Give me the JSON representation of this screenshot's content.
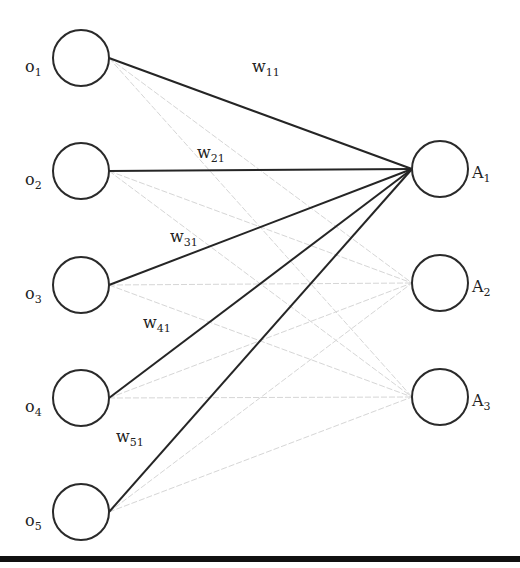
{
  "diagram": {
    "type": "fully-connected two-layer network",
    "colors": {
      "strong_edge": "#252525",
      "weak_edge": "#d6d6d6",
      "node_stroke": "#2a2a2a",
      "bottom_rule": "#111111"
    },
    "input_nodes": [
      {
        "id": "o1",
        "base": "o",
        "sub": "1",
        "cx": 81,
        "cy": 58
      },
      {
        "id": "o2",
        "base": "o",
        "sub": "2",
        "cx": 81,
        "cy": 171
      },
      {
        "id": "o3",
        "base": "o",
        "sub": "3",
        "cx": 81,
        "cy": 285
      },
      {
        "id": "o4",
        "base": "o",
        "sub": "4",
        "cx": 81,
        "cy": 398
      },
      {
        "id": "o5",
        "base": "o",
        "sub": "5",
        "cx": 81,
        "cy": 512
      }
    ],
    "output_nodes": [
      {
        "id": "A1",
        "base": "A",
        "sub": "1",
        "cx": 440,
        "cy": 169
      },
      {
        "id": "A2",
        "base": "A",
        "sub": "2",
        "cx": 440,
        "cy": 283
      },
      {
        "id": "A3",
        "base": "A",
        "sub": "3",
        "cx": 440,
        "cy": 397
      }
    ],
    "node_radius": 28,
    "highlighted_target": "A1",
    "weight_labels": [
      {
        "id": "w11",
        "base": "w",
        "sub": "11",
        "x": 252,
        "y": 72
      },
      {
        "id": "w21",
        "base": "w",
        "sub": "21",
        "x": 197,
        "y": 158
      },
      {
        "id": "w31",
        "base": "w",
        "sub": "31",
        "x": 170,
        "y": 242
      },
      {
        "id": "w41",
        "base": "w",
        "sub": "41",
        "x": 143,
        "y": 328
      },
      {
        "id": "w51",
        "base": "w",
        "sub": "51",
        "x": 116,
        "y": 442
      }
    ]
  }
}
